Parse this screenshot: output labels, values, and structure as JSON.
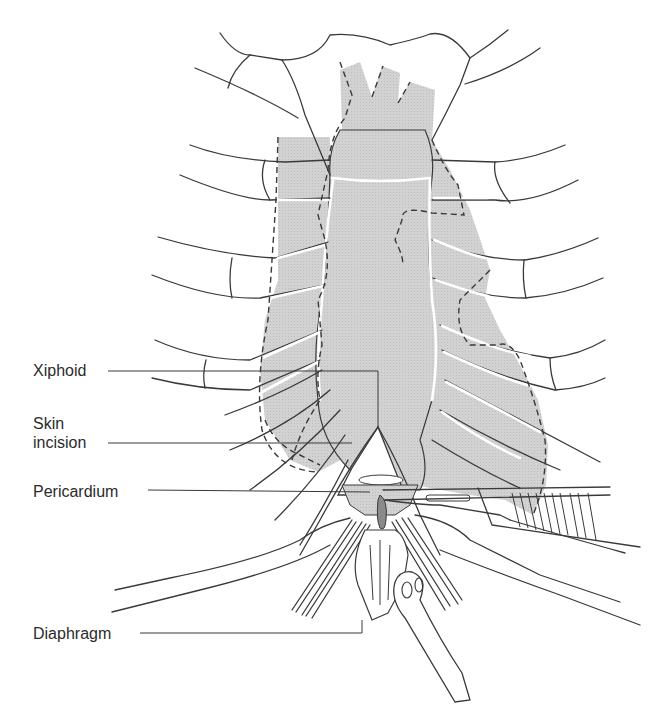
{
  "figure": {
    "colors": {
      "shading": "#cfcfcf",
      "line": "#3a3a3a",
      "background": "#ffffff"
    }
  },
  "labels": [
    {
      "id": "xiphoid",
      "text": "Xiphoid"
    },
    {
      "id": "skin_incision",
      "text": "Skin\nincision"
    },
    {
      "id": "pericardium",
      "text": "Pericardium"
    },
    {
      "id": "diaphragm",
      "text": "Diaphragm"
    }
  ]
}
